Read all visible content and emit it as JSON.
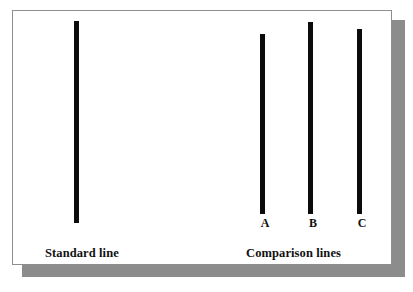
{
  "figure": {
    "background_color": "#ffffff",
    "card": {
      "background_color": "#ffffff",
      "border_color": "#8e8e8e",
      "shadow_color": "#8c8c8c"
    },
    "line_color": "#0b0b0b",
    "captions": {
      "standard": "Standard line",
      "comparison": "Comparison lines"
    },
    "standard_line": {
      "name": "standard",
      "x": 73,
      "top": 20,
      "bottom": 222,
      "length_px": 202,
      "width_px": 5
    },
    "comparison_lines": [
      {
        "label": "A",
        "x": 259,
        "top": 33,
        "bottom": 213,
        "length_px": 180,
        "width_px": 5,
        "label_x": 254,
        "label_y": 216
      },
      {
        "label": "B",
        "x": 307,
        "top": 21,
        "bottom": 213,
        "length_px": 192,
        "width_px": 5,
        "label_x": 302,
        "label_y": 216
      },
      {
        "label": "C",
        "x": 356,
        "top": 28,
        "bottom": 213,
        "length_px": 185,
        "width_px": 5,
        "label_x": 351,
        "label_y": 216
      }
    ]
  }
}
